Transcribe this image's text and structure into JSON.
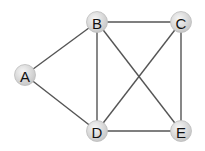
{
  "graph": {
    "nodes": [
      {
        "id": "A",
        "label": "A",
        "x": 25,
        "y": 75
      },
      {
        "id": "B",
        "label": "B",
        "x": 97,
        "y": 22
      },
      {
        "id": "C",
        "label": "C",
        "x": 181,
        "y": 22
      },
      {
        "id": "D",
        "label": "D",
        "x": 97,
        "y": 131
      },
      {
        "id": "E",
        "label": "E",
        "x": 181,
        "y": 131
      }
    ],
    "edges": [
      [
        "A",
        "B"
      ],
      [
        "A",
        "D"
      ],
      [
        "B",
        "C"
      ],
      [
        "B",
        "D"
      ],
      [
        "B",
        "E"
      ],
      [
        "C",
        "D"
      ],
      [
        "C",
        "E"
      ],
      [
        "D",
        "E"
      ]
    ],
    "node_fill": "#dcdcdc",
    "edge_color": "#555555"
  }
}
